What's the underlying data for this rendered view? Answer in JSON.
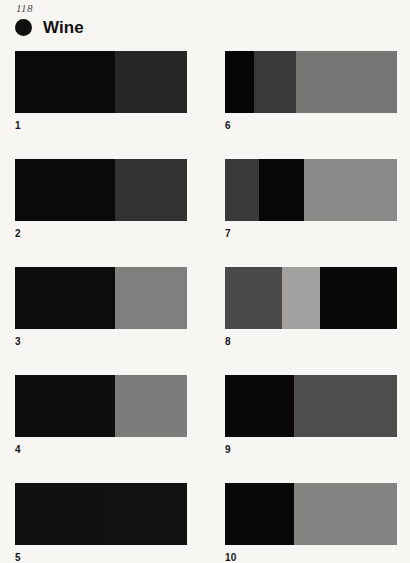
{
  "page": {
    "number": "118",
    "background_color": "#f7f6f2"
  },
  "header": {
    "bullet_icon": "filled-circle-icon",
    "bullet_color": "#100f0f",
    "title": "Wine"
  },
  "swatches": [
    {
      "label": "1",
      "segments": [
        {
          "color": "#0d0a0b",
          "width_pct": 58
        },
        {
          "color": "#272526",
          "width_pct": 42
        }
      ]
    },
    {
      "label": "2",
      "segments": [
        {
          "color": "#0c090a",
          "width_pct": 58
        },
        {
          "color": "#333132",
          "width_pct": 42
        }
      ]
    },
    {
      "label": "3",
      "segments": [
        {
          "color": "#0e0b0c",
          "width_pct": 58
        },
        {
          "color": "#807f7e",
          "width_pct": 42
        }
      ]
    },
    {
      "label": "4",
      "segments": [
        {
          "color": "#100d0e",
          "width_pct": 58
        },
        {
          "color": "#7c7b7a",
          "width_pct": 42
        }
      ]
    },
    {
      "label": "5",
      "segments": [
        {
          "color": "#120f10",
          "width_pct": 51
        },
        {
          "color": "#141112",
          "width_pct": 49
        }
      ]
    },
    {
      "label": "6",
      "segments": [
        {
          "color": "#070506",
          "width_pct": 17
        },
        {
          "color": "#3a3839",
          "width_pct": 24
        },
        {
          "color": "#777675",
          "width_pct": 59
        }
      ]
    },
    {
      "label": "7",
      "segments": [
        {
          "color": "#3b3939",
          "width_pct": 20
        },
        {
          "color": "#080607",
          "width_pct": 26
        },
        {
          "color": "#8a8988",
          "width_pct": 54
        }
      ]
    },
    {
      "label": "8",
      "segments": [
        {
          "color": "#4b4a4a",
          "width_pct": 33
        },
        {
          "color": "#a2a1a0",
          "width_pct": 22
        },
        {
          "color": "#0b0809",
          "width_pct": 45
        }
      ]
    },
    {
      "label": "9",
      "segments": [
        {
          "color": "#0a0708",
          "width_pct": 40
        },
        {
          "color": "#4e4d4d",
          "width_pct": 60
        }
      ]
    },
    {
      "label": "10",
      "segments": [
        {
          "color": "#0a0708",
          "width_pct": 40
        },
        {
          "color": "#848382",
          "width_pct": 60
        }
      ]
    }
  ]
}
